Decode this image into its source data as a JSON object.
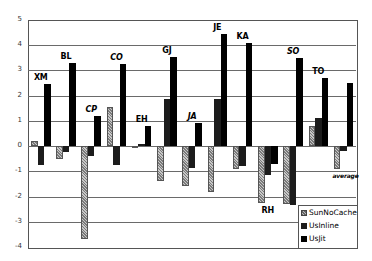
{
  "chart_data": {
    "type": "bar",
    "title": "",
    "xlabel": "",
    "ylabel": "",
    "ylim": [
      -4,
      5
    ],
    "yticks": [
      5,
      4,
      3,
      2,
      1,
      0,
      -1,
      -2,
      -3,
      -4
    ],
    "grid": true,
    "legend_position": "bottom-right inside",
    "categories": [
      "XM",
      "BL",
      "CP",
      "CO",
      "EH",
      "GJ",
      "JA",
      "JE",
      "KA",
      "RH",
      "SO",
      "TO",
      "average"
    ],
    "label_positions": [
      "above",
      "above",
      "above",
      "above",
      "above",
      "above",
      "above",
      "above",
      "above",
      "below",
      "above",
      "above",
      "below"
    ],
    "series": [
      {
        "name": "SunNoCache",
        "values": [
          0.2,
          -0.5,
          -3.7,
          1.55,
          0.0,
          -1.4,
          -1.6,
          -1.8,
          -0.9,
          -2.25,
          -2.3,
          0.8,
          -0.9
        ]
      },
      {
        "name": "UsInline",
        "values": [
          -0.75,
          -0.25,
          -0.4,
          -0.75,
          0.1,
          1.85,
          -0.85,
          1.85,
          -0.8,
          -1.15,
          -2.35,
          1.1,
          -0.2
        ]
      },
      {
        "name": "UsJit",
        "values": [
          2.45,
          3.3,
          1.2,
          3.25,
          0.8,
          3.55,
          0.9,
          4.45,
          4.1,
          -0.7,
          3.5,
          2.7,
          2.5
        ]
      }
    ]
  },
  "legend": {
    "items": [
      {
        "label": "SunNoCache",
        "key": "sun"
      },
      {
        "label": "UsInline",
        "key": "inline"
      },
      {
        "label": "UsJit",
        "key": "jit"
      }
    ]
  },
  "colors": {
    "sun": "#9a9a9a",
    "inline": "#1c1c1c",
    "jit": "#000000",
    "grid": "#6a6a6a"
  }
}
